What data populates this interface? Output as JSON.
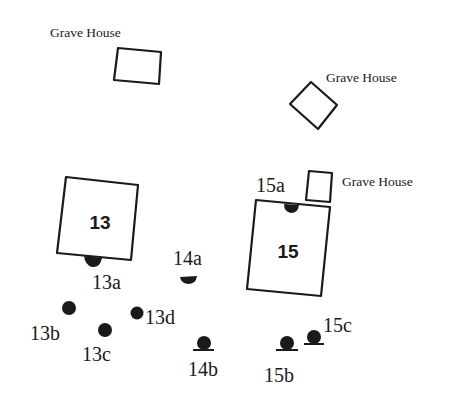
{
  "diagram": {
    "type": "site-plan",
    "grave_houses": [
      {
        "label": "Grave House",
        "label_pos": [
          50,
          37
        ]
      },
      {
        "label": "Grave House",
        "label_pos": [
          325,
          82
        ]
      },
      {
        "label": "Grave House",
        "label_pos": [
          342,
          185
        ]
      }
    ],
    "structures": [
      {
        "id": "13",
        "label": "13"
      },
      {
        "id": "15",
        "label": "15"
      }
    ],
    "features": [
      {
        "id": "13a",
        "label": "13a"
      },
      {
        "id": "13b",
        "label": "13b"
      },
      {
        "id": "13c",
        "label": "13c"
      },
      {
        "id": "13d",
        "label": "13d"
      },
      {
        "id": "14a",
        "label": "14a"
      },
      {
        "id": "14b",
        "label": "14b"
      },
      {
        "id": "15a",
        "label": "15a"
      },
      {
        "id": "15b",
        "label": "15b"
      },
      {
        "id": "15c",
        "label": "15c"
      }
    ]
  }
}
